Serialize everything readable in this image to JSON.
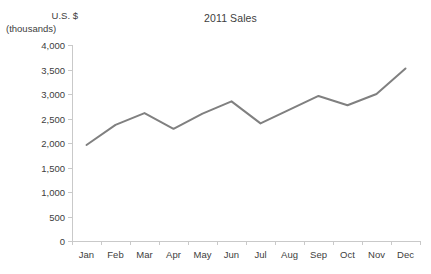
{
  "chart_data": {
    "type": "line",
    "title": "2011 Sales",
    "xlabel": "",
    "ylabel": "U.S. $ (thousands)",
    "ylabel_lines": [
      "U.S. $",
      "(thousands)"
    ],
    "categories": [
      "Jan",
      "Feb",
      "Mar",
      "Apr",
      "May",
      "Jun",
      "Jul",
      "Aug",
      "Sep",
      "Oct",
      "Nov",
      "Dec"
    ],
    "values": [
      1960,
      2370,
      2610,
      2290,
      2600,
      2850,
      2400,
      2680,
      2960,
      2770,
      3000,
      3520
    ],
    "series": [
      {
        "name": "2011 Sales",
        "values": [
          1960,
          2370,
          2610,
          2290,
          2600,
          2850,
          2400,
          2680,
          2960,
          2770,
          3000,
          3520
        ]
      }
    ],
    "ylim": [
      0,
      4000
    ],
    "ytick_step": 500,
    "ytick_labels": [
      "4,000",
      "3,500",
      "3,000",
      "2,500",
      "2,000",
      "1,500",
      "1,000",
      "500",
      "0"
    ],
    "ytick_values": [
      4000,
      3500,
      3000,
      2500,
      2000,
      1500,
      1000,
      500,
      0
    ],
    "grid": false,
    "legend": false,
    "legend_position": "none",
    "line_color": "#808080",
    "axis_color": "#c9c9c9",
    "text_color": "#404040",
    "background_color": "#ffffff",
    "markers": false
  }
}
